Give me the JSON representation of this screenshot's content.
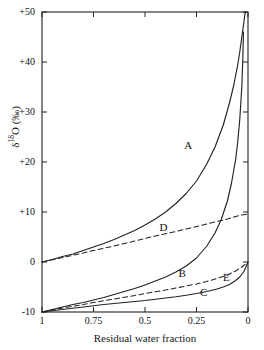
{
  "chart_data": {
    "type": "line",
    "title": "",
    "xlabel": "Residual water fraction",
    "ylabel_html": "δ<sup>18</sup>O (‰)",
    "ylabel": "δ18O (‰)",
    "xlim": [
      1,
      0
    ],
    "ylim": [
      -10,
      50
    ],
    "x_ticks": [
      "1",
      "0.75",
      "0.5",
      "0.25",
      "0"
    ],
    "x_tick_values": [
      1,
      0.75,
      0.5,
      0.25,
      0
    ],
    "y_ticks": [
      "+50",
      "+40",
      "+30",
      "+20",
      "+10",
      "0",
      "-10"
    ],
    "y_tick_values": [
      50,
      40,
      30,
      20,
      10,
      0,
      -10
    ],
    "grid": false,
    "legend": "inline-curve-labels",
    "axis_color": "#222222",
    "curve_color": "#222222",
    "series": [
      {
        "name": "A",
        "label": "A",
        "style": "solid",
        "label_x": 0.29,
        "label_y": 23.5,
        "x": [
          1.0,
          0.95,
          0.9,
          0.85,
          0.8,
          0.75,
          0.7,
          0.65,
          0.6,
          0.55,
          0.5,
          0.45,
          0.4,
          0.35,
          0.3,
          0.25,
          0.2,
          0.16,
          0.12,
          0.09,
          0.07,
          0.05,
          0.04,
          0.03,
          0.02,
          0.015,
          0.012
        ],
        "y": [
          0.0,
          0.5,
          1.1,
          1.6,
          2.3,
          3.0,
          3.7,
          4.5,
          5.4,
          6.3,
          7.4,
          8.6,
          10.0,
          11.7,
          13.7,
          16.2,
          19.6,
          23.0,
          27.4,
          31.8,
          35.2,
          39.4,
          42.0,
          45.0,
          48.0,
          49.5,
          50.0
        ]
      },
      {
        "name": "B",
        "label": "B",
        "style": "solid",
        "label_x": 0.32,
        "label_y": -2.2,
        "x": [
          1.0,
          0.95,
          0.9,
          0.85,
          0.8,
          0.75,
          0.7,
          0.65,
          0.6,
          0.55,
          0.5,
          0.45,
          0.4,
          0.35,
          0.3,
          0.25,
          0.2,
          0.16,
          0.13,
          0.1,
          0.08,
          0.06,
          0.05,
          0.04,
          0.03,
          0.025,
          0.022
        ],
        "y": [
          -10.0,
          -9.5,
          -9.0,
          -8.5,
          -8.1,
          -7.6,
          -7.1,
          -6.5,
          -5.9,
          -5.3,
          -4.6,
          -3.8,
          -3.0,
          -2.0,
          -0.8,
          0.8,
          3.2,
          5.8,
          8.5,
          12.2,
          15.8,
          20.5,
          24.0,
          28.5,
          35.0,
          41.0,
          46.0
        ]
      },
      {
        "name": "C",
        "label": "C",
        "style": "solid",
        "label_x": 0.215,
        "label_y": -6.0,
        "x": [
          1.0,
          0.95,
          0.9,
          0.85,
          0.8,
          0.75,
          0.7,
          0.65,
          0.6,
          0.55,
          0.5,
          0.45,
          0.4,
          0.35,
          0.3,
          0.25,
          0.2,
          0.15,
          0.12,
          0.09,
          0.06,
          0.04,
          0.02,
          0.01,
          0.0
        ],
        "y": [
          -10.0,
          -9.75,
          -9.5,
          -9.25,
          -9.0,
          -8.75,
          -8.5,
          -8.3,
          -8.1,
          -7.9,
          -7.7,
          -7.45,
          -7.2,
          -6.95,
          -6.65,
          -6.3,
          -5.9,
          -5.4,
          -5.0,
          -4.5,
          -3.7,
          -3.0,
          -1.9,
          -1.0,
          0.0
        ]
      },
      {
        "name": "D",
        "label": "D",
        "style": "dashed",
        "label_x": 0.41,
        "label_y": 7.0,
        "x": [
          1.0,
          0.95,
          0.9,
          0.85,
          0.8,
          0.75,
          0.7,
          0.65,
          0.6,
          0.55,
          0.5,
          0.45,
          0.4,
          0.35,
          0.3,
          0.25,
          0.2,
          0.15,
          0.1,
          0.06,
          0.03,
          0.0
        ],
        "y": [
          0.0,
          0.45,
          0.9,
          1.35,
          1.8,
          2.3,
          2.75,
          3.2,
          3.7,
          4.2,
          4.7,
          5.2,
          5.65,
          6.1,
          6.6,
          7.1,
          7.6,
          8.1,
          8.6,
          9.1,
          9.4,
          9.6
        ]
      },
      {
        "name": "E",
        "label": "E",
        "style": "dashed",
        "label_x": 0.105,
        "label_y": -3.0,
        "x": [
          1.0,
          0.95,
          0.9,
          0.85,
          0.8,
          0.75,
          0.7,
          0.65,
          0.6,
          0.55,
          0.5,
          0.45,
          0.4,
          0.35,
          0.3,
          0.25,
          0.2,
          0.15,
          0.1,
          0.06,
          0.03,
          0.0
        ],
        "y": [
          -10.0,
          -9.6,
          -9.2,
          -8.85,
          -8.5,
          -8.1,
          -7.75,
          -7.4,
          -7.05,
          -6.7,
          -6.3,
          -5.95,
          -5.6,
          -5.2,
          -4.8,
          -4.4,
          -3.9,
          -3.3,
          -2.6,
          -1.8,
          -1.0,
          0.0
        ]
      }
    ]
  }
}
